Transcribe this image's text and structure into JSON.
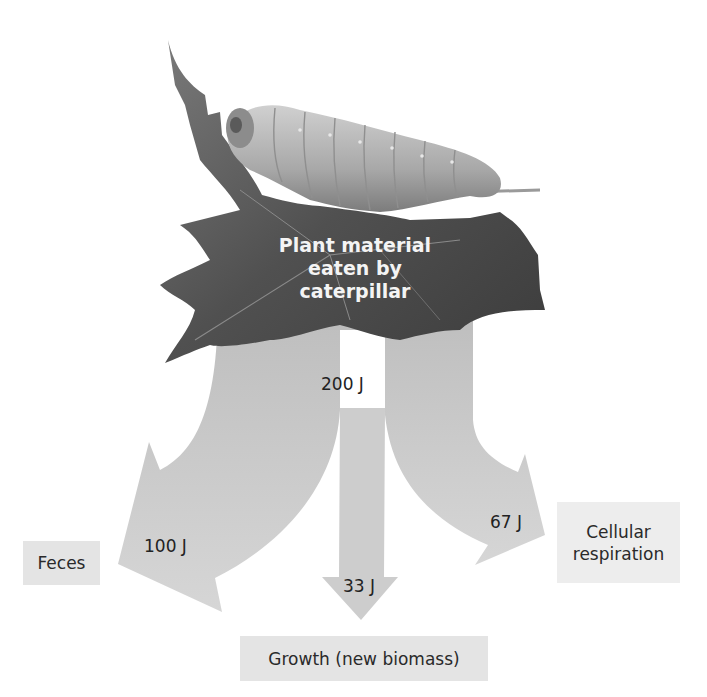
{
  "diagram": {
    "source": {
      "label_line1": "Plant material",
      "label_line2": "eaten by caterpillar",
      "illustration": "caterpillar-on-leaf"
    },
    "input_energy": "200 J",
    "flows": [
      {
        "id": "feces",
        "value": "100 J",
        "destination": "Feces"
      },
      {
        "id": "growth",
        "value": "33 J",
        "destination": "Growth (new biomass)"
      },
      {
        "id": "respiration",
        "value": "67 J",
        "destination_line1": "Cellular",
        "destination_line2": "respiration"
      }
    ],
    "colors": {
      "arrow_fill": "#c2c2c2",
      "arrow_light": "#d8d8d8",
      "label_box": "#e4e4e4",
      "leaf_dark": "#4a4a4a",
      "caterpillar": "#bcbcbc"
    }
  }
}
